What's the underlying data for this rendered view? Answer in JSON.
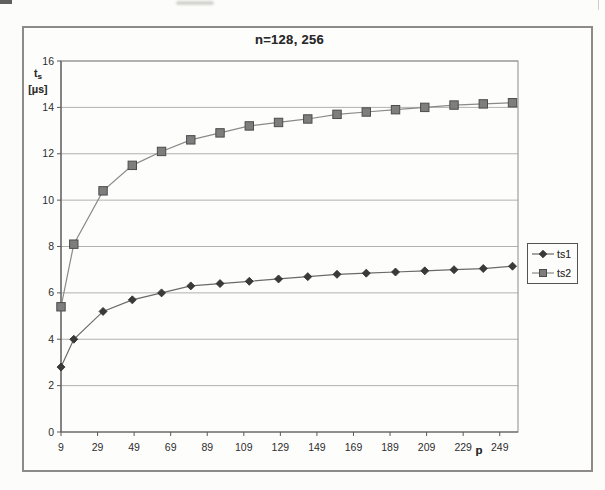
{
  "chart": {
    "y_axis_label": {
      "t": "t",
      "sub": "s",
      "unit": "[μs]"
    }
  },
  "chart_data": {
    "type": "line",
    "title": "n=128, 256",
    "xlabel": "p",
    "ylabel": "ts [μs]",
    "x": [
      9,
      16,
      32,
      48,
      64,
      80,
      96,
      112,
      128,
      144,
      160,
      176,
      192,
      208,
      224,
      240,
      256
    ],
    "series": [
      {
        "name": "ts1",
        "marker": "diamond",
        "line_color": "#6a6a6a",
        "marker_fill": "#3a3a3a",
        "marker_edge": "#2b2b2b",
        "values": [
          2.8,
          4.0,
          5.2,
          5.7,
          6.0,
          6.3,
          6.4,
          6.5,
          6.6,
          6.7,
          6.8,
          6.85,
          6.9,
          6.95,
          7.0,
          7.05,
          7.15
        ]
      },
      {
        "name": "ts2",
        "marker": "square",
        "line_color": "#8a8a8a",
        "marker_fill": "#7e7e7e",
        "marker_edge": "#4c4c4c",
        "values": [
          5.4,
          8.1,
          10.4,
          11.5,
          12.1,
          12.6,
          12.9,
          13.2,
          13.35,
          13.5,
          13.7,
          13.8,
          13.9,
          14.0,
          14.1,
          14.15,
          14.2
        ]
      }
    ],
    "xticks": [
      9,
      29,
      49,
      69,
      89,
      109,
      129,
      149,
      169,
      189,
      209,
      229,
      249
    ],
    "yticks": [
      0,
      2,
      4,
      6,
      8,
      10,
      12,
      14,
      16
    ],
    "xlim": [
      9,
      259
    ],
    "ylim": [
      0,
      16
    ],
    "grid": true,
    "legend_position": "right"
  },
  "colors": {
    "grid": "#b3b1ad",
    "axis": "#5a5a5a",
    "plot_border": "#8c8c8c",
    "tick_text": "#2e2e2e",
    "frame_border": "#8d8b87"
  }
}
